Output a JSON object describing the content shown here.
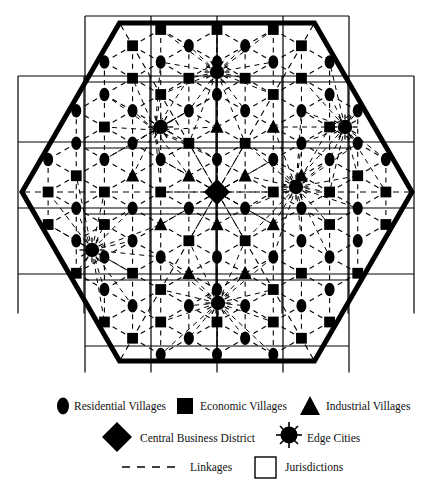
{
  "figure": {
    "type": "central-place-hexagon-diagram",
    "title": "",
    "background_color": "#ffffff",
    "ink_color": "#000000"
  },
  "legend": {
    "rows": [
      {
        "items": [
          {
            "symbol": "ellipse",
            "label": "Residential Villages",
            "name": "residential-villages"
          },
          {
            "symbol": "square",
            "label": "Economic Villages",
            "name": "economic-villages"
          },
          {
            "symbol": "triangle",
            "label": "Industrial Villages",
            "name": "industrial-villages"
          }
        ]
      },
      {
        "items": [
          {
            "symbol": "diamond",
            "label": "Central Business District",
            "name": "central-business-district"
          },
          {
            "symbol": "starburst-circle",
            "label": "Edge Cities",
            "name": "edge-cities"
          }
        ]
      },
      {
        "items": [
          {
            "symbol": "dashed-line",
            "label": "Linkages",
            "name": "linkages"
          },
          {
            "symbol": "open-square",
            "label": "Jurisdictions",
            "name": "jurisdictions"
          }
        ]
      }
    ]
  },
  "diagram_data": {
    "hexagon": {
      "center": [
        217,
        192
      ],
      "radius": 195,
      "orientation": "pointy-left-right",
      "stroke_width": 5,
      "vertices": [
        [
          22,
          192
        ],
        [
          119.5,
          23
        ],
        [
          314.5,
          23
        ],
        [
          412,
          192
        ],
        [
          314.5,
          361
        ],
        [
          119.5,
          361
        ]
      ]
    },
    "jurisdiction_grid": {
      "note": "Overlapping offset rectangular jurisdiction boundaries drawn as thin squares",
      "cell_size": 66,
      "cols": 6,
      "rows": 5,
      "origin": [
        18,
        16
      ],
      "stroke_width": 1.2
    },
    "central_business_district": {
      "x": 217,
      "y": 192
    },
    "edge_cities": [
      {
        "x": 217,
        "y": 72
      },
      {
        "x": 155,
        "y": 130
      },
      {
        "x": 345,
        "y": 127
      },
      {
        "x": 296,
        "y": 187
      },
      {
        "x": 92,
        "y": 250
      },
      {
        "x": 218,
        "y": 303
      }
    ],
    "counts": {
      "residential_villages": 47,
      "economic_villages": 33,
      "industrial_villages": 14,
      "edge_cities": 6,
      "central_business_district": 1
    }
  }
}
